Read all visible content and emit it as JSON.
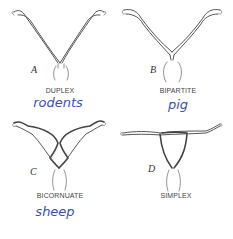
{
  "figure": {
    "panels": [
      {
        "id": "A",
        "letter": "A",
        "caption": "DUPLEX",
        "annotation": "rodents"
      },
      {
        "id": "B",
        "letter": "B",
        "caption": "BIPARTITE",
        "annotation": "pig"
      },
      {
        "id": "C",
        "letter": "C",
        "caption": "BICORNUATE",
        "annotation": "sheep"
      },
      {
        "id": "D",
        "letter": "D",
        "caption": "SIMPLEX",
        "annotation": ""
      }
    ]
  },
  "colors": {
    "line": "#555555",
    "caption": "#444444",
    "handwriting": "#3a4fb5",
    "background": "#ffffff"
  }
}
